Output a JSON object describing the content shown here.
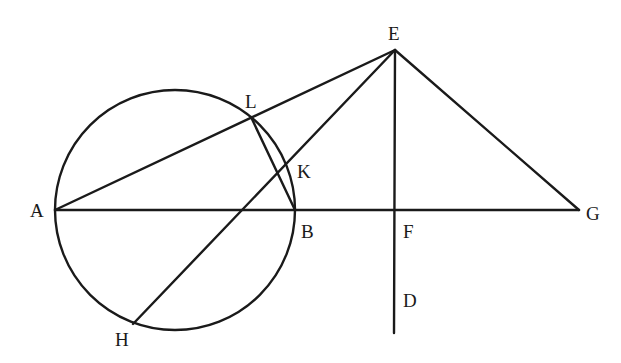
{
  "diagram": {
    "title": "",
    "stroke_color": "#1a1a1a",
    "background": "#ffffff",
    "circle": {
      "cx": 175,
      "cy": 210,
      "r": 120
    },
    "points": {
      "A": {
        "x": 55,
        "y": 210,
        "label": "A",
        "lx": 30,
        "ly": 217
      },
      "B": {
        "x": 295,
        "y": 210,
        "label": "B",
        "lx": 301,
        "ly": 238
      },
      "E": {
        "x": 395,
        "y": 50,
        "label": "E",
        "lx": 388,
        "ly": 40
      },
      "F": {
        "x": 395,
        "y": 210,
        "label": "F",
        "lx": 403,
        "ly": 238
      },
      "G": {
        "x": 579,
        "y": 210,
        "label": "G",
        "lx": 586,
        "ly": 220
      },
      "D": {
        "x": 394,
        "y": 333,
        "label": "D",
        "lx": 403,
        "ly": 307
      },
      "H": {
        "x": 133,
        "y": 324,
        "label": "H",
        "lx": 115,
        "ly": 346
      },
      "L": {
        "x": 251,
        "y": 117,
        "label": "L",
        "lx": 245,
        "ly": 108
      },
      "K": {
        "x": 278,
        "y": 174,
        "label": "K",
        "lx": 297,
        "ly": 178
      }
    },
    "segments": [
      {
        "from": "A",
        "to": "G",
        "name": "line-AG"
      },
      {
        "from": "A",
        "to": "E",
        "name": "line-AE"
      },
      {
        "from": "E",
        "to": "H",
        "name": "line-EH"
      },
      {
        "from": "E",
        "to": "D",
        "name": "line-ED"
      },
      {
        "from": "E",
        "to": "G",
        "name": "line-EG"
      },
      {
        "from": "L",
        "to": "B",
        "name": "line-LB"
      }
    ]
  }
}
